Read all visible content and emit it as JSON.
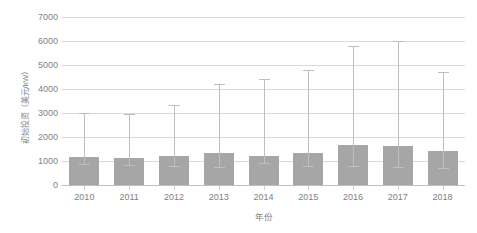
{
  "chart_data": {
    "type": "bar",
    "title": "",
    "xlabel": "年份",
    "ylabel": "初始投资（美元/kW）",
    "categories": [
      "2010",
      "2011",
      "2012",
      "2013",
      "2014",
      "2015",
      "2016",
      "2017",
      "2018"
    ],
    "values": [
      1180,
      1130,
      1200,
      1350,
      1220,
      1320,
      1650,
      1630,
      1400
    ],
    "error_high": [
      3000,
      2950,
      3350,
      4200,
      4400,
      4800,
      5800,
      6000,
      4700
    ],
    "error_low": [
      880,
      850,
      800,
      750,
      900,
      800,
      780,
      760,
      700
    ],
    "ylim": [
      0,
      7000
    ],
    "yticks": [
      0,
      1000,
      2000,
      3000,
      4000,
      5000,
      6000,
      7000
    ],
    "ytick_labels": [
      "0",
      "1000",
      "2000",
      "3000",
      "4000",
      "5000",
      "6000",
      "7000"
    ],
    "grid": true,
    "legend": "none",
    "series": [
      {
        "name": "初始投资",
        "values": [
          1180,
          1130,
          1200,
          1350,
          1220,
          1320,
          1650,
          1630,
          1400
        ]
      }
    ],
    "colors": {
      "bar": "#a6a6a6",
      "whisker": "#bfbfbf",
      "gridline": "#d9d9d9",
      "axis": "#bfbfbf",
      "text": "#7f7f7f"
    }
  }
}
